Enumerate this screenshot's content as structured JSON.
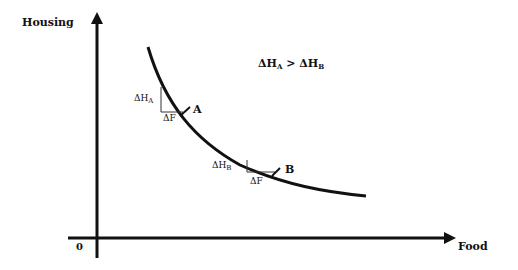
{
  "diagram": {
    "y_axis_label": "Housing",
    "x_axis_label": "Food",
    "origin_label": "0",
    "relation": {
      "lhs": "ΔH",
      "lhs_sub": "A",
      "op": " > ",
      "rhs": "ΔH",
      "rhs_sub": "B"
    },
    "point_a": {
      "label": "A",
      "dh": "ΔH",
      "dh_sub": "A",
      "df": "ΔF"
    },
    "point_b": {
      "label": "B",
      "dh": "ΔH",
      "dh_sub": "B",
      "df": "ΔF"
    },
    "curve_type": "indifference-curve"
  }
}
